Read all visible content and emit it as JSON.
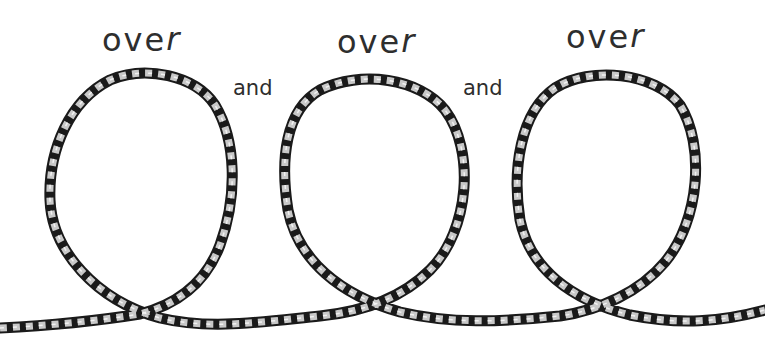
{
  "diagram": {
    "type": "illustration",
    "labels": {
      "over_1": "ove",
      "over_1_r": "r",
      "and_1": "and",
      "over_2": "ove",
      "over_2_r": "r",
      "and_2": "and",
      "over_3": "ove",
      "over_3_r": "r"
    },
    "full_caption": "over and over and over",
    "cord": {
      "dark_strand_color": "#1a1a1a",
      "light_strand_color": "#c8c8c8",
      "loop_count": 3
    },
    "background_color": "#ffffff",
    "text_color": "#2e2e2e"
  }
}
